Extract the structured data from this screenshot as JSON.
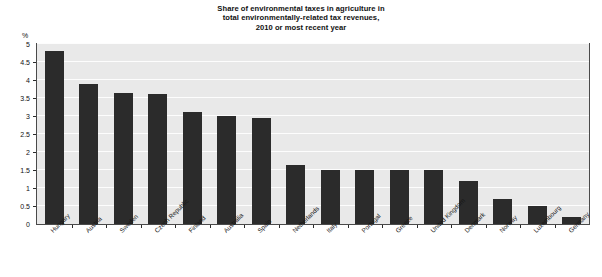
{
  "chart_data": {
    "type": "bar",
    "title": "Share of environmental taxes in agriculture in total environmentally-related tax revenues, 2010 or most recent year",
    "title_lines": [
      "Share of environmental taxes in agriculture in",
      "total environmentally-related tax revenues,",
      "2010 or most recent year"
    ],
    "xlabel": "",
    "ylabel": "%",
    "ylim": [
      0,
      5
    ],
    "ytick_labels": [
      "0",
      "0.5",
      "1",
      "1.5",
      "2",
      "2.5",
      "3",
      "3.5",
      "4",
      "4.5",
      "5"
    ],
    "ytick_values": [
      0,
      0.5,
      1,
      1.5,
      2,
      2.5,
      3,
      3.5,
      4,
      4.5,
      5
    ],
    "grid": true,
    "legend": "none",
    "bar_color": "#2b2b2b",
    "plot_background": "#e9e9e9",
    "gridline_color": "#fdfdfd",
    "categories": [
      "Hungary",
      "Austria",
      "Sweden",
      "Czech Republic",
      "Finland",
      "Australia",
      "Spain",
      "Netherlands",
      "Italy",
      "Portugal",
      "Greece",
      "United Kingdom",
      "Denmark",
      "Norway",
      "Luxembourg",
      "Germany"
    ],
    "values": [
      4.8,
      3.9,
      3.65,
      3.6,
      3.1,
      3.0,
      2.95,
      1.65,
      1.5,
      1.5,
      1.5,
      1.5,
      1.2,
      0.7,
      0.5,
      0.2
    ]
  }
}
